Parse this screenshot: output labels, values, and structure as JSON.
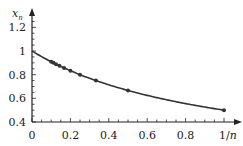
{
  "chart_data": {
    "type": "line",
    "title": "",
    "xlabel": "1/n",
    "ylabel": "x_n",
    "xlim": [
      0,
      1.05
    ],
    "ylim": [
      0.4,
      1.25
    ],
    "grid": false,
    "legend": null,
    "x_ticks": [
      "0",
      "0.2",
      "0.4",
      "0.6",
      "0.8",
      "1/n"
    ],
    "y_ticks": [
      "0.4",
      "0.6",
      "0.8",
      "1",
      "1.2"
    ],
    "series": [
      {
        "name": "curve x = 1/(1+1/n)",
        "kind": "line",
        "x": [
          0,
          0.05,
          0.1,
          0.15,
          0.2,
          0.25,
          0.3,
          0.35,
          0.4,
          0.45,
          0.5,
          0.55,
          0.6,
          0.65,
          0.7,
          0.75,
          0.8,
          0.85,
          0.9,
          0.95,
          1.0
        ],
        "values": [
          1.0,
          0.952,
          0.909,
          0.87,
          0.833,
          0.8,
          0.769,
          0.741,
          0.714,
          0.69,
          0.667,
          0.645,
          0.625,
          0.606,
          0.588,
          0.571,
          0.556,
          0.541,
          0.526,
          0.513,
          0.5
        ]
      },
      {
        "name": "points x_n = n/(n+1)",
        "kind": "scatter",
        "x": [
          1.0,
          0.5,
          0.333,
          0.25,
          0.2,
          0.167,
          0.143,
          0.125,
          0.111,
          0.1
        ],
        "values": [
          0.5,
          0.667,
          0.75,
          0.8,
          0.833,
          0.857,
          0.875,
          0.889,
          0.9,
          0.909
        ]
      }
    ]
  },
  "axes": {
    "y_label_main": "x",
    "y_label_sub": "n",
    "x_label": "1/n"
  }
}
